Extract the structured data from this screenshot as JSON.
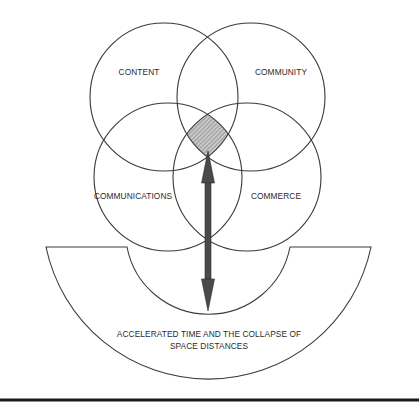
{
  "diagram": {
    "circles": [
      {
        "id": "content",
        "label": "CONTENT"
      },
      {
        "id": "community",
        "label": "COMMUNITY"
      },
      {
        "id": "communications",
        "label": "COMMUNICATIONS"
      },
      {
        "id": "commerce",
        "label": "COMMERCE"
      }
    ],
    "base": {
      "label_line1": "ACCELERATED TIME AND THE COLLAPSE OF",
      "label_line2": "SPACE DISTANCES"
    },
    "intersection": {
      "description": "shaded overlap of all four circles",
      "fill": "#b0b0b0"
    },
    "arrow": {
      "type": "double-headed vertical",
      "color": "#4a4a4a"
    },
    "colors": {
      "stroke": "#3a3a3a",
      "background": "#ffffff",
      "rule": "#1a1a1a"
    }
  }
}
